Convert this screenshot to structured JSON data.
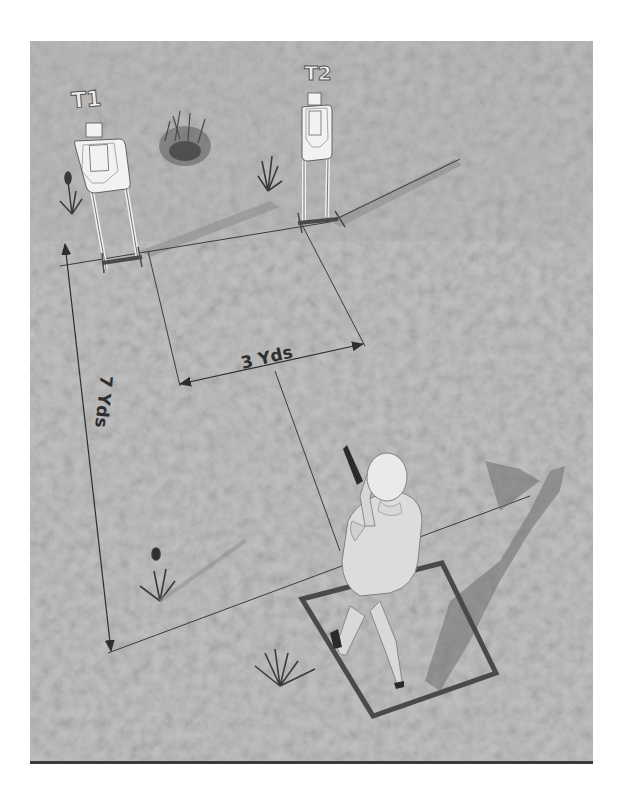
{
  "diagram": {
    "type": "shooting-drill-layout",
    "targets": [
      {
        "id": "t1",
        "label": "T1"
      },
      {
        "id": "t2",
        "label": "T2"
      }
    ],
    "dimensions": [
      {
        "id": "lateral",
        "label": "3 Yds",
        "between": "T1 and T2 (lateral spacing)"
      },
      {
        "id": "depth",
        "label": "7 Yds",
        "between": "target line and shooting box"
      }
    ],
    "shooter": {
      "position": "inside shooting box",
      "posture": "standing, pistol raised"
    },
    "colors": {
      "ground": "#b4b4b4",
      "ground_dark": "#9a9a9a",
      "target_face": "#f2f2f2",
      "lines": "#3c3c3c",
      "box": "#4a4a4a",
      "shadow": "#7a7a7a",
      "label_fill": "#eeeeee",
      "dimension_text": "#2e2e2e"
    }
  }
}
